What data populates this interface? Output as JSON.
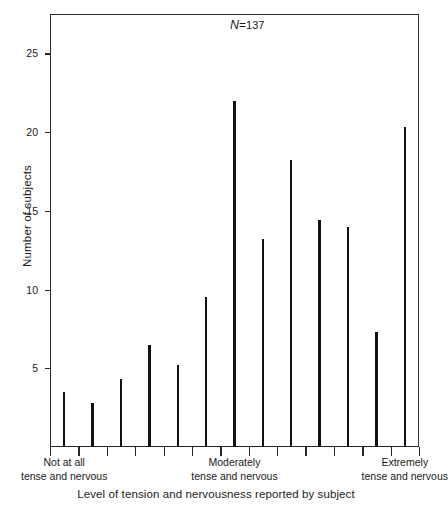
{
  "chart_data": {
    "type": "bar",
    "title": "",
    "subtitle": "",
    "xlabel": "Level of tension and nervousness reported by subject",
    "ylabel": "Number of subjects",
    "annotation": {
      "symbol": "N",
      "equals": "=",
      "value": "137",
      "full": "N=137"
    },
    "ylim": [
      0,
      27.5
    ],
    "yticks": [
      5,
      10,
      15,
      20,
      25
    ],
    "ytick_labels": [
      "5",
      "10",
      "15",
      "20",
      "25"
    ],
    "grid": false,
    "legend": null,
    "x_category_labels": [
      {
        "line1": "Not at all",
        "line2": "tense and nervous",
        "position": 1
      },
      {
        "line1": "Moderately",
        "line2": "tense and nervous",
        "position": 7
      },
      {
        "line1": "Extremely",
        "line2": "tense and nervous",
        "position": 13
      }
    ],
    "categories": [
      "1",
      "2",
      "3",
      "4",
      "5",
      "6",
      "7",
      "8",
      "9",
      "10",
      "11",
      "12",
      "13"
    ],
    "values": [
      3.5,
      2.8,
      4.3,
      6.5,
      5.2,
      9.5,
      22.0,
      13.2,
      18.2,
      14.4,
      14.0,
      7.3,
      20.3
    ],
    "n_xticks": 14
  }
}
